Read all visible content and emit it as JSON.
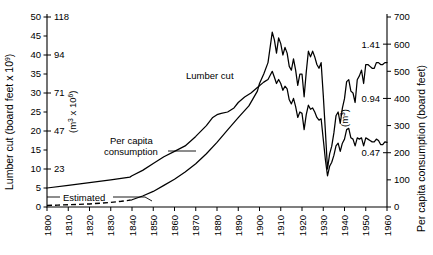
{
  "chart_data": {
    "type": "line",
    "title": "",
    "xlabel": "",
    "x_ticks": [
      "1800",
      "1810",
      "1820",
      "1830",
      "1840",
      "1850",
      "1860",
      "1870",
      "1880",
      "1890",
      "1900",
      "1910",
      "1920",
      "1930",
      "1940",
      "1950",
      "1960"
    ],
    "xlim": [
      1800,
      1960
    ],
    "axes": {
      "left_primary": {
        "label": "Lumber cut (board feet x 10",
        "label_sup": "9",
        "label_suffix": ")",
        "ticks": [
          0,
          5,
          10,
          15,
          20,
          25,
          30,
          35,
          40,
          45,
          50
        ],
        "ylim": [
          0,
          50
        ],
        "unit": "board feet x 10^9"
      },
      "left_secondary": {
        "label": "(m",
        "label_sup": "3",
        "label_mid": " x 10",
        "label_sup2": "6",
        "label_suffix": ")",
        "ticks": [
          23,
          47,
          71,
          94,
          118
        ],
        "tick_positions_primary": [
          10,
          20,
          30,
          40,
          50
        ],
        "unit": "m^3 x 10^6"
      },
      "right_primary": {
        "label": "Per capita consumption (board feet)",
        "ticks": [
          0,
          100,
          200,
          300,
          400,
          500,
          600,
          700
        ],
        "ylim": [
          0,
          700
        ],
        "unit": "board feet"
      },
      "right_secondary": {
        "label": "(m",
        "label_sup": "3",
        "label_suffix": ")",
        "ticks": [
          "0.47",
          "0.94",
          "1.41"
        ],
        "tick_positions_primary": [
          200,
          400,
          600
        ],
        "unit": "m^3"
      }
    },
    "grid": false,
    "legend": "inline-annotations",
    "annotations": [
      {
        "name": "lumber-cut-label",
        "text": "Lumber cut",
        "x": 1887,
        "y_primary": 34
      },
      {
        "name": "per-capita-label-line1",
        "text": "Per capita",
        "x": 1848,
        "y_primary": 16
      },
      {
        "name": "per-capita-label-line2",
        "text": "consumption",
        "x": 1848,
        "y_primary": 13
      },
      {
        "name": "estimated-label",
        "text": "Estimated",
        "x": 1817,
        "y_primary": 3
      }
    ],
    "series": [
      {
        "name": "Lumber cut",
        "axis": "left",
        "unit": "board feet x 10^9",
        "estimated_range": [
          1800,
          1839
        ],
        "points": [
          [
            1800,
            0.4
          ],
          [
            1805,
            0.5
          ],
          [
            1810,
            0.6
          ],
          [
            1815,
            0.7
          ],
          [
            1820,
            0.8
          ],
          [
            1825,
            1.0
          ],
          [
            1830,
            1.2
          ],
          [
            1835,
            1.5
          ],
          [
            1839,
            1.8
          ],
          [
            1840,
            1.9
          ],
          [
            1845,
            2.9
          ],
          [
            1850,
            4.1
          ],
          [
            1855,
            5.7
          ],
          [
            1860,
            7.3
          ],
          [
            1865,
            9.2
          ],
          [
            1870,
            11.4
          ],
          [
            1875,
            14.0
          ],
          [
            1880,
            17.0
          ],
          [
            1885,
            20.3
          ],
          [
            1890,
            23.5
          ],
          [
            1895,
            26.6
          ],
          [
            1899,
            30.5
          ],
          [
            1900,
            32.5
          ],
          [
            1902,
            35.0
          ],
          [
            1904,
            38.0
          ],
          [
            1906,
            46.0
          ],
          [
            1907,
            44.0
          ],
          [
            1908,
            40.5
          ],
          [
            1909,
            44.5
          ],
          [
            1910,
            43.0
          ],
          [
            1911,
            40.0
          ],
          [
            1912,
            42.0
          ],
          [
            1913,
            40.5
          ],
          [
            1914,
            37.0
          ],
          [
            1915,
            36.0
          ],
          [
            1916,
            39.0
          ],
          [
            1917,
            36.0
          ],
          [
            1918,
            32.0
          ],
          [
            1919,
            35.0
          ],
          [
            1920,
            35.0
          ],
          [
            1921,
            29.0
          ],
          [
            1922,
            35.5
          ],
          [
            1923,
            41.0
          ],
          [
            1924,
            39.5
          ],
          [
            1925,
            41.0
          ],
          [
            1926,
            39.5
          ],
          [
            1927,
            37.5
          ],
          [
            1928,
            36.5
          ],
          [
            1929,
            38.0
          ],
          [
            1930,
            29.5
          ],
          [
            1931,
            20.0
          ],
          [
            1932,
            10.0
          ],
          [
            1933,
            14.0
          ],
          [
            1934,
            16.0
          ],
          [
            1935,
            19.5
          ],
          [
            1936,
            24.0
          ],
          [
            1937,
            25.0
          ],
          [
            1938,
            22.0
          ],
          [
            1939,
            26.0
          ],
          [
            1940,
            28.5
          ],
          [
            1941,
            33.0
          ],
          [
            1942,
            33.5
          ],
          [
            1943,
            30.5
          ],
          [
            1944,
            30.0
          ],
          [
            1945,
            27.5
          ],
          [
            1946,
            33.5
          ],
          [
            1947,
            34.5
          ],
          [
            1948,
            36.0
          ],
          [
            1949,
            32.5
          ],
          [
            1950,
            37.5
          ],
          [
            1951,
            37.5
          ],
          [
            1952,
            37.0
          ],
          [
            1953,
            36.5
          ],
          [
            1954,
            36.5
          ],
          [
            1955,
            38.0
          ],
          [
            1956,
            38.0
          ],
          [
            1957,
            37.5
          ],
          [
            1958,
            37.5
          ],
          [
            1959,
            38.0
          ],
          [
            1960,
            38.0
          ]
        ]
      },
      {
        "name": "Per capita consumption",
        "axis": "right",
        "unit": "board feet",
        "points": [
          [
            1800,
            70
          ],
          [
            1810,
            80
          ],
          [
            1820,
            90
          ],
          [
            1830,
            100
          ],
          [
            1839,
            110
          ],
          [
            1840,
            115
          ],
          [
            1845,
            135
          ],
          [
            1850,
            160
          ],
          [
            1855,
            185
          ],
          [
            1860,
            205
          ],
          [
            1865,
            225
          ],
          [
            1870,
            260
          ],
          [
            1875,
            300
          ],
          [
            1878,
            330
          ],
          [
            1880,
            340
          ],
          [
            1882,
            345
          ],
          [
            1885,
            350
          ],
          [
            1888,
            365
          ],
          [
            1890,
            385
          ],
          [
            1893,
            405
          ],
          [
            1896,
            420
          ],
          [
            1899,
            440
          ],
          [
            1902,
            460
          ],
          [
            1904,
            470
          ],
          [
            1906,
            500
          ],
          [
            1907,
            478
          ],
          [
            1908,
            455
          ],
          [
            1909,
            470
          ],
          [
            1910,
            455
          ],
          [
            1911,
            430
          ],
          [
            1912,
            445
          ],
          [
            1913,
            435
          ],
          [
            1914,
            395
          ],
          [
            1915,
            380
          ],
          [
            1916,
            400
          ],
          [
            1917,
            370
          ],
          [
            1918,
            330
          ],
          [
            1919,
            350
          ],
          [
            1920,
            345
          ],
          [
            1921,
            285
          ],
          [
            1922,
            340
          ],
          [
            1923,
            375
          ],
          [
            1924,
            360
          ],
          [
            1925,
            365
          ],
          [
            1926,
            350
          ],
          [
            1927,
            330
          ],
          [
            1928,
            320
          ],
          [
            1929,
            325
          ],
          [
            1930,
            250
          ],
          [
            1931,
            175
          ],
          [
            1932,
            115
          ],
          [
            1933,
            150
          ],
          [
            1934,
            165
          ],
          [
            1935,
            190
          ],
          [
            1936,
            225
          ],
          [
            1937,
            235
          ],
          [
            1938,
            205
          ],
          [
            1939,
            235
          ],
          [
            1940,
            250
          ],
          [
            1941,
            285
          ],
          [
            1942,
            290
          ],
          [
            1943,
            255
          ],
          [
            1944,
            250
          ],
          [
            1945,
            225
          ],
          [
            1946,
            255
          ],
          [
            1947,
            250
          ],
          [
            1948,
            255
          ],
          [
            1949,
            225
          ],
          [
            1950,
            255
          ],
          [
            1951,
            250
          ],
          [
            1952,
            245
          ],
          [
            1953,
            240
          ],
          [
            1954,
            240
          ],
          [
            1955,
            250
          ],
          [
            1956,
            245
          ],
          [
            1957,
            230
          ],
          [
            1958,
            230
          ],
          [
            1959,
            240
          ],
          [
            1960,
            238
          ]
        ]
      }
    ]
  }
}
